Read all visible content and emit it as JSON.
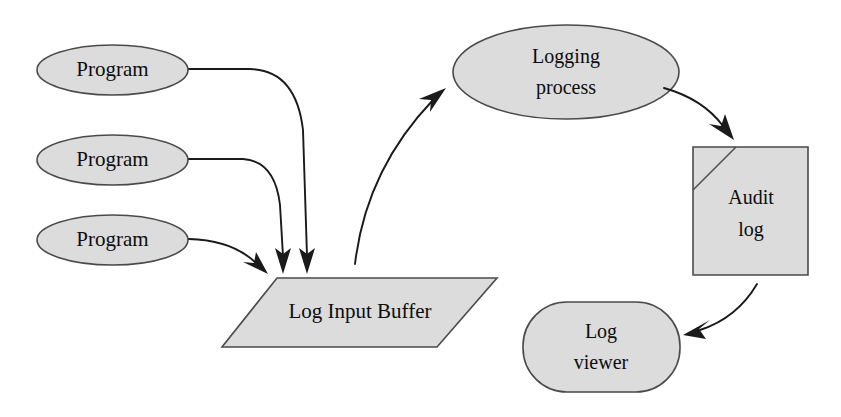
{
  "diagram": {
    "colors": {
      "shape_fill": "#dcdcdc",
      "shape_stroke": "#4a4a4a",
      "connector": "#1a1a1a",
      "text": "#0d0d0d",
      "background": "#ffffff"
    },
    "nodes": [
      {
        "id": "program1",
        "label": "Program",
        "shape": "ellipse"
      },
      {
        "id": "program2",
        "label": "Program",
        "shape": "ellipse"
      },
      {
        "id": "program3",
        "label": "Program",
        "shape": "ellipse"
      },
      {
        "id": "log_input_buffer",
        "label": "Log Input Buffer",
        "shape": "parallelogram"
      },
      {
        "id": "logging_process",
        "label_line1": "Logging",
        "label_line2": "process",
        "shape": "ellipse"
      },
      {
        "id": "audit_log",
        "label_line1": "Audit",
        "label_line2": "log",
        "shape": "document-folded-corner"
      },
      {
        "id": "log_viewer",
        "label_line1": "Log",
        "label_line2": "viewer",
        "shape": "rounded-rectangle"
      }
    ],
    "edges": [
      {
        "id": "e1",
        "from": "program1",
        "to": "log_input_buffer",
        "arrow": true
      },
      {
        "id": "e2",
        "from": "program2",
        "to": "log_input_buffer",
        "arrow": true
      },
      {
        "id": "e3",
        "from": "program3",
        "to": "log_input_buffer",
        "arrow": true
      },
      {
        "id": "e4",
        "from": "log_input_buffer",
        "to": "logging_process",
        "arrow": true
      },
      {
        "id": "e5",
        "from": "logging_process",
        "to": "audit_log",
        "arrow": true
      },
      {
        "id": "e6",
        "from": "audit_log",
        "to": "log_viewer",
        "arrow": true
      }
    ]
  }
}
